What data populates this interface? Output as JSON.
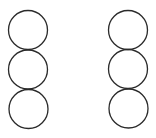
{
  "diagram": {
    "width": 156,
    "height": 138,
    "background": "#ffffff",
    "stroke_color": "#2a2a2a",
    "stroke_width": 1.3,
    "columns": [
      {
        "name": "left-column",
        "circles": [
          {
            "cx": 28,
            "cy": 30,
            "r": 19.5
          },
          {
            "cx": 28,
            "cy": 69.5,
            "r": 19.5
          },
          {
            "cx": 28.5,
            "cy": 109,
            "r": 19.5
          }
        ]
      },
      {
        "name": "right-column",
        "circles": [
          {
            "cx": 128,
            "cy": 30,
            "r": 19.5
          },
          {
            "cx": 128,
            "cy": 69,
            "r": 19.5
          },
          {
            "cx": 128.5,
            "cy": 108.5,
            "r": 19.5
          }
        ]
      }
    ]
  }
}
